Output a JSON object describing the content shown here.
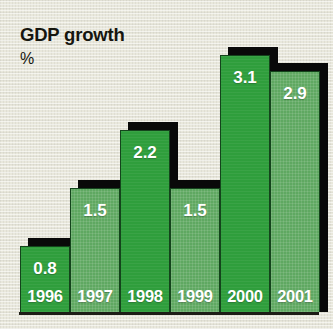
{
  "title": "GDP growth",
  "unit": "%",
  "chart_data": {
    "type": "bar",
    "title": "GDP growth",
    "subtitle": "%",
    "xlabel": "",
    "ylabel": "%",
    "ylim": [
      0,
      3.4
    ],
    "grid": false,
    "legend": null,
    "categories": [
      "1996",
      "1997",
      "1998",
      "1999",
      "2000",
      "2001"
    ],
    "values": [
      0.8,
      1.5,
      2.2,
      1.5,
      3.1,
      2.9
    ],
    "value_labels": [
      "0.8",
      "1.5",
      "2.2",
      "1.5",
      "3.1",
      "2.9"
    ],
    "series": [
      {
        "name": "GDP growth",
        "values": [
          0.8,
          1.5,
          2.2,
          1.5,
          3.1,
          2.9
        ]
      }
    ],
    "bars": [
      {
        "category": "1996",
        "value": 0.8,
        "value_label": "0.8",
        "tone": "dark"
      },
      {
        "category": "1997",
        "value": 1.5,
        "value_label": "1.5",
        "tone": "light"
      },
      {
        "category": "1998",
        "value": 2.2,
        "value_label": "2.2",
        "tone": "dark"
      },
      {
        "category": "1999",
        "value": 1.5,
        "value_label": "1.5",
        "tone": "light"
      },
      {
        "category": "2000",
        "value": 3.1,
        "value_label": "3.1",
        "tone": "dark"
      },
      {
        "category": "2001",
        "value": 2.9,
        "value_label": "2.9",
        "tone": "light"
      }
    ]
  },
  "colors": {
    "background": "#e9e8dc",
    "bar_dark_green": "#2f9e3c",
    "bar_light_green": "#5fa861",
    "shadow": "#090909",
    "value_text": "#ffffff",
    "title_text": "#16160f",
    "baseline": "#1d1d16"
  }
}
